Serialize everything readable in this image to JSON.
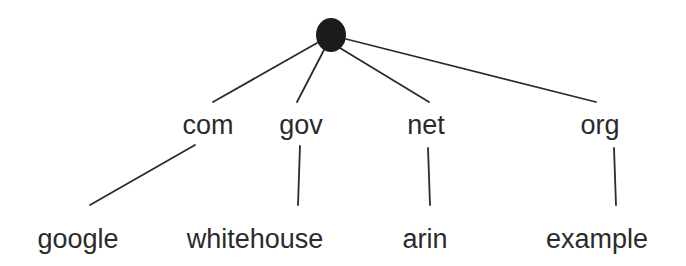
{
  "diagram": {
    "type": "tree",
    "root": {
      "label": "",
      "shape": "filled-circle",
      "color": "#1c1c1c"
    },
    "tlds": [
      {
        "label": "com"
      },
      {
        "label": "gov"
      },
      {
        "label": "net"
      },
      {
        "label": "org"
      }
    ],
    "domains": [
      {
        "label": "google",
        "parent": "com"
      },
      {
        "label": "whitehouse",
        "parent": "gov"
      },
      {
        "label": "arin",
        "parent": "net"
      },
      {
        "label": "example",
        "parent": "org"
      }
    ],
    "line_color": "#2b2b2b",
    "text_color": "#2b2b2b"
  }
}
